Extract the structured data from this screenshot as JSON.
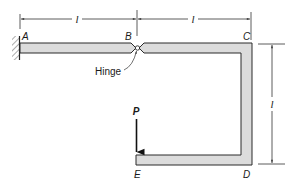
{
  "diagram": {
    "type": "structural-frame",
    "points": {
      "A": "A",
      "B": "B",
      "C": "C",
      "D": "D",
      "E": "E"
    },
    "hinge_label": "Hinge",
    "load_label": "P",
    "dimensions": {
      "AB": "l",
      "BC": "l",
      "CD": "l"
    },
    "colors": {
      "member_fill": "#dcdcdc",
      "member_stroke": "#2a2a2a",
      "line": "#333333"
    }
  }
}
